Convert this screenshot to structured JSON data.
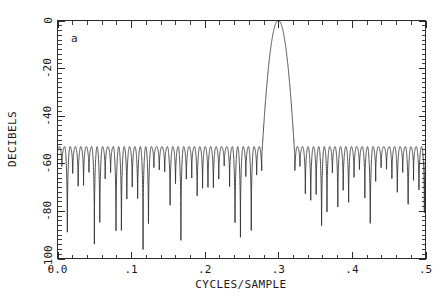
{
  "figure": {
    "panel_label": "a",
    "background_color": "#ffffff",
    "line_color": "#2f2f2f",
    "axis_color": "#2b2b2b"
  },
  "chart_data": {
    "type": "line",
    "title": "",
    "subtitle": "",
    "panel_label": "a",
    "xlabel": "CYCLES/SAMPLE",
    "ylabel": "DECIBELS",
    "xlim": [
      0.0,
      0.5
    ],
    "ylim": [
      -100,
      0
    ],
    "grid": false,
    "legend": null,
    "x_ticks": [
      0.0,
      0.1,
      0.2,
      0.3,
      0.4,
      0.5
    ],
    "x_ticklabels": [
      "0.0",
      ".1",
      ".2",
      ".3",
      ".4",
      ".5"
    ],
    "x_minor_tick_step": 0.02,
    "y_ticks": [
      0,
      -20,
      -40,
      -60,
      -80,
      -100
    ],
    "y_ticklabels": [
      "0",
      "-20",
      "-40",
      "-60",
      "-80",
      "-100"
    ],
    "y_minor_tick_step": 2,
    "y_tick_label_rotation": -90,
    "series": [
      {
        "name": "magnitude-response",
        "main_lobe_center": 0.3,
        "main_lobe_peak_db": 0,
        "main_lobe_left_edge": 0.2775,
        "main_lobe_right_edge": 0.3225,
        "sidelobe_level_db": -53,
        "ripple_period": 0.00735,
        "deep_null_positions": [
          0.0478,
          0.1695,
          0.3585
        ],
        "deep_null_db": -100
      }
    ]
  }
}
